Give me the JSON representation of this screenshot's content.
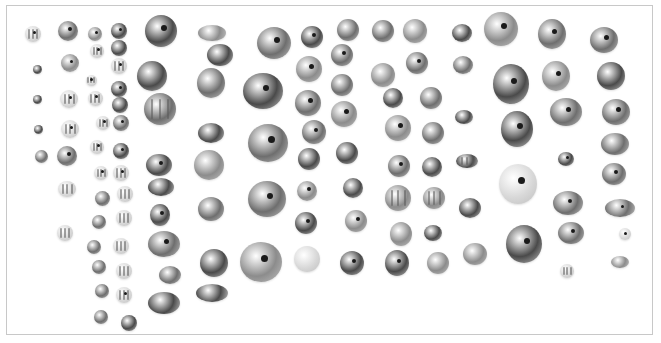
{
  "image": {
    "subject": "photograph of assorted beads arranged in columns",
    "tone": "grayscale",
    "palette": {
      "background": "#ffffff",
      "border": "#c8c8c8",
      "dark": "#4a4a4a",
      "mid": "#6e6e6e",
      "light": "#8c8c8c",
      "pale": "#d8d8d8",
      "hole": "#1a1a1a"
    }
  }
}
